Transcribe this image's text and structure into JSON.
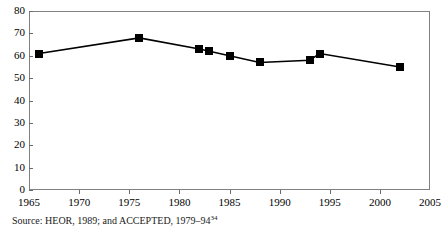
{
  "chart_data": {
    "type": "line",
    "title": "",
    "xlabel": "",
    "ylabel": "",
    "xlim": [
      1965,
      2005
    ],
    "ylim": [
      0,
      80
    ],
    "grid": false,
    "legend": null,
    "marker": "filled-square",
    "line_color": "#000000",
    "marker_color": "#000000",
    "x": [
      1966,
      1976,
      1982,
      1983,
      1985,
      1988,
      1993,
      1994,
      2002
    ],
    "values": [
      61,
      68,
      63,
      62,
      60,
      57,
      58,
      61,
      55
    ],
    "series": [
      {
        "name": "",
        "x": [
          1966,
          1976,
          1982,
          1983,
          1985,
          1988,
          1993,
          1994,
          2002
        ],
        "values": [
          61,
          68,
          63,
          62,
          60,
          57,
          58,
          61,
          55
        ]
      }
    ],
    "yticks": [
      0,
      10,
      20,
      30,
      40,
      50,
      60,
      70,
      80
    ],
    "ytick_labels": [
      "0",
      "10",
      "20",
      "30",
      "40",
      "50",
      "60",
      "70",
      "80"
    ],
    "xticks": [
      1965,
      1970,
      1975,
      1980,
      1985,
      1990,
      1995,
      2000,
      2005
    ],
    "xtick_labels": [
      "1965",
      "1970",
      "1975",
      "1980",
      "1985",
      "1990",
      "1995",
      "2000",
      "2005"
    ]
  },
  "caption": {
    "text": "Source: HEOR, 1989; and ACCEPTED, 1979–94",
    "footnote_marker": "34"
  }
}
